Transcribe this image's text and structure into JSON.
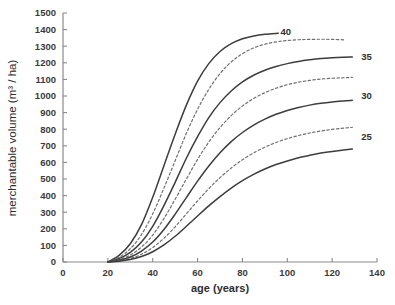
{
  "chart_data": {
    "type": "line",
    "title": "",
    "xlabel": "age (years)",
    "ylabel": "merchantable volume (m³ / ha)",
    "xlim": [
      0,
      140
    ],
    "ylim": [
      0,
      1500
    ],
    "xticks": [
      0,
      20,
      40,
      60,
      80,
      100,
      120,
      140
    ],
    "yticks": [
      0,
      100,
      200,
      300,
      400,
      500,
      600,
      700,
      800,
      900,
      1000,
      1100,
      1200,
      1300,
      1400,
      1500
    ],
    "xtick_labels": [
      "0",
      "20",
      "40",
      "60",
      "80",
      "100",
      "120",
      "140"
    ],
    "ytick_labels": [
      "0",
      "100",
      "200",
      "300",
      "400",
      "500",
      "600",
      "700",
      "800",
      "900",
      "1000",
      "1100",
      "1200",
      "1300",
      "1400",
      "1500"
    ],
    "grid": false,
    "legend": "inline-end-labels",
    "x_start": 20,
    "series": [
      {
        "name": "40",
        "label": "40",
        "style": "solid",
        "color": "#3d3d3d",
        "label_x": 97,
        "label_y": 1390,
        "x": [
          20,
          25,
          30,
          35,
          40,
          45,
          50,
          55,
          60,
          65,
          70,
          75,
          80,
          85,
          90,
          96
        ],
        "values": [
          0,
          40,
          110,
          225,
          390,
          580,
          770,
          945,
          1090,
          1195,
          1268,
          1315,
          1345,
          1362,
          1372,
          1378
        ]
      },
      {
        "name": "37.5",
        "label": "",
        "style": "dashed",
        "color": "#6f6f6f",
        "x": [
          20,
          25,
          30,
          35,
          40,
          45,
          50,
          55,
          60,
          65,
          70,
          75,
          80,
          85,
          90,
          95,
          100,
          105,
          110,
          115,
          120,
          126
        ],
        "values": [
          0,
          28,
          80,
          165,
          290,
          445,
          610,
          775,
          920,
          1040,
          1135,
          1205,
          1255,
          1290,
          1312,
          1326,
          1334,
          1339,
          1341,
          1342,
          1341,
          1338
        ]
      },
      {
        "name": "35",
        "label": "35",
        "style": "solid",
        "color": "#3d3d3d",
        "label_x": 133,
        "label_y": 1240,
        "x": [
          20,
          25,
          30,
          35,
          40,
          45,
          50,
          55,
          60,
          65,
          70,
          75,
          80,
          85,
          90,
          95,
          100,
          105,
          110,
          115,
          120,
          125,
          129
        ],
        "values": [
          0,
          20,
          58,
          120,
          215,
          340,
          480,
          625,
          755,
          870,
          960,
          1030,
          1085,
          1125,
          1155,
          1178,
          1195,
          1208,
          1218,
          1226,
          1231,
          1234,
          1235
        ]
      },
      {
        "name": "32.5",
        "label": "",
        "style": "dashed",
        "color": "#6f6f6f",
        "x": [
          20,
          25,
          30,
          35,
          40,
          45,
          50,
          55,
          60,
          65,
          70,
          75,
          80,
          85,
          90,
          95,
          100,
          105,
          110,
          115,
          120,
          125,
          129
        ],
        "values": [
          0,
          14,
          42,
          90,
          162,
          262,
          378,
          500,
          618,
          722,
          810,
          882,
          940,
          985,
          1020,
          1047,
          1068,
          1083,
          1094,
          1102,
          1107,
          1110,
          1112
        ]
      },
      {
        "name": "30",
        "label": "30",
        "style": "solid",
        "color": "#3d3d3d",
        "label_x": 133,
        "label_y": 1000,
        "x": [
          20,
          25,
          30,
          35,
          40,
          45,
          50,
          55,
          60,
          65,
          70,
          75,
          80,
          85,
          90,
          95,
          100,
          105,
          110,
          115,
          120,
          125,
          129
        ],
        "values": [
          0,
          10,
          30,
          66,
          120,
          196,
          288,
          388,
          487,
          578,
          658,
          725,
          780,
          825,
          861,
          890,
          913,
          931,
          945,
          956,
          964,
          970,
          974
        ]
      },
      {
        "name": "27.5",
        "label": "",
        "style": "dashed",
        "color": "#6f6f6f",
        "x": [
          20,
          25,
          30,
          35,
          40,
          45,
          50,
          55,
          60,
          65,
          70,
          75,
          80,
          85,
          90,
          95,
          100,
          105,
          110,
          115,
          120,
          125,
          129
        ],
        "values": [
          0,
          7,
          21,
          47,
          87,
          143,
          212,
          290,
          368,
          442,
          508,
          566,
          616,
          657,
          692,
          720,
          743,
          762,
          777,
          789,
          799,
          806,
          811
        ]
      },
      {
        "name": "25",
        "label": "25",
        "style": "solid",
        "color": "#3d3d3d",
        "label_x": 133,
        "label_y": 755,
        "x": [
          20,
          25,
          30,
          35,
          40,
          45,
          50,
          55,
          60,
          65,
          70,
          75,
          80,
          85,
          90,
          95,
          100,
          105,
          110,
          115,
          120,
          125,
          129
        ],
        "values": [
          0,
          5,
          15,
          33,
          62,
          103,
          155,
          215,
          277,
          338,
          394,
          445,
          490,
          528,
          560,
          587,
          609,
          628,
          643,
          656,
          666,
          674,
          680
        ]
      }
    ]
  }
}
